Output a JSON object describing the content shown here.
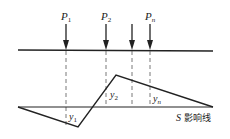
{
  "diagram": {
    "loads": [
      {
        "label": "P",
        "sub": "1",
        "x": 66
      },
      {
        "label": "P",
        "sub": "2",
        "x": 106
      },
      {
        "label": "",
        "sub": "",
        "x": 132
      },
      {
        "label": "P",
        "sub": "n",
        "x": 150
      }
    ],
    "ordinates": [
      {
        "label": "y",
        "sub": "1"
      },
      {
        "label": "y",
        "sub": "2"
      },
      {
        "label": "y",
        "sub": "n"
      }
    ],
    "influence_line_label_var": "S",
    "influence_line_label_text": "影响线",
    "colors": {
      "stroke": "#222222",
      "dash": "#555555"
    }
  }
}
